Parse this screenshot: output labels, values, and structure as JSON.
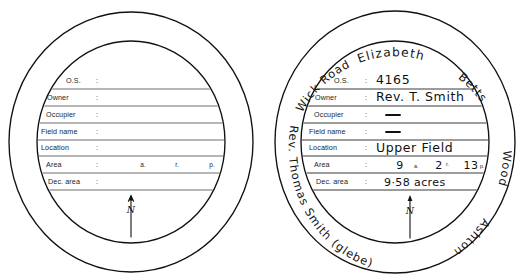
{
  "figure": {
    "caption_sliver": "",
    "background_color": "#ffffff",
    "ink_color": "#111111",
    "rule_color": "#6f6f6f"
  },
  "field_labels": {
    "os": "O.S.",
    "owner": "Owner",
    "occupier": "Occupier",
    "field_name": "Field name",
    "location": "Location",
    "area": "Area",
    "dec_area": "Dec. area",
    "colon": ":"
  },
  "area_units": {
    "acres": "a.",
    "roods": "r.",
    "perches": "p."
  },
  "north_arrow": {
    "symbol": "N",
    "name": "north-arrow"
  },
  "diagrams": [
    {
      "id": "blank",
      "title": "blank-template",
      "rows": [
        {
          "label": "O.S.",
          "value": ""
        },
        {
          "label": "Owner",
          "value": ""
        },
        {
          "label": "Occupier",
          "value": ""
        },
        {
          "label": "Field name",
          "value": ""
        },
        {
          "label": "Location",
          "value": ""
        },
        {
          "label": "Area",
          "value": ""
        },
        {
          "label": "Dec. area",
          "value": ""
        }
      ],
      "area_values": {
        "acres": "",
        "roods": "",
        "perches": ""
      },
      "annulus_texts": []
    },
    {
      "id": "filled",
      "title": "completed-example",
      "rows": [
        {
          "label": "O.S.",
          "value": "4165"
        },
        {
          "label": "Owner",
          "value": "Rev. T. Smith"
        },
        {
          "label": "Occupier",
          "value": "—"
        },
        {
          "label": "Field name",
          "value": "—"
        },
        {
          "label": "Location",
          "value": "Upper Field"
        },
        {
          "label": "Area",
          "value": "9 a.  2 r.  13 p."
        },
        {
          "label": "Dec. area",
          "value": "9·58 acres"
        }
      ],
      "area_values": {
        "acres": "9",
        "roods": "2",
        "perches": "13"
      },
      "annulus_texts": [
        {
          "position": "top-left",
          "text": "Wick Road"
        },
        {
          "position": "top-center",
          "text": "Elizabeth"
        },
        {
          "position": "top-right",
          "text": "Betts"
        },
        {
          "position": "right",
          "text": "Wood"
        },
        {
          "position": "bottom-right",
          "text": "Ashton"
        },
        {
          "position": "left",
          "text": "Rev. Thomas Smith (glebe)"
        }
      ]
    }
  ]
}
